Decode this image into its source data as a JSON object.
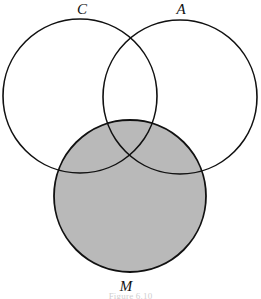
{
  "figure": {
    "caption": "Figure 6.10",
    "background_color": "#ffffff",
    "stroke_color": "#111111",
    "stroke_width": 1.6,
    "shaded_fill_color": "#b9b9b9"
  },
  "sets": [
    {
      "id": "C",
      "label": "C",
      "label_x": 82,
      "label_y": 14,
      "cx": 80,
      "cy": 96,
      "r": 77,
      "shaded": false
    },
    {
      "id": "A",
      "label": "A",
      "label_x": 181,
      "label_y": 14,
      "cx": 180,
      "cy": 97,
      "r": 77,
      "shaded": false
    },
    {
      "id": "M",
      "label": "M",
      "label_x": 126,
      "label_y": 291,
      "cx": 130,
      "cy": 196,
      "r": 76,
      "shaded": true
    }
  ]
}
